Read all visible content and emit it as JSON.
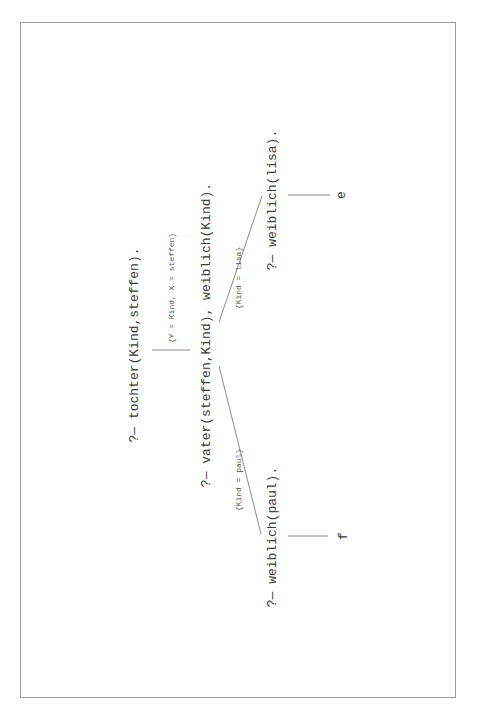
{
  "diagram": {
    "type": "sld-resolution-tree",
    "orientation": "rotated-90-ccw",
    "root": {
      "goal": "?— tochter(Kind,steffen)."
    },
    "step1": {
      "substitution": "{Y = Kind, X = steffen}",
      "goal": "?— vater(steffen,Kind), weiblich(Kind)."
    },
    "branches": [
      {
        "substitution": "{Kind = lisa}",
        "goal": "?— weiblich(lisa).",
        "result": "e"
      },
      {
        "substitution": "{Kind = paul}",
        "goal": "?— weiblich(paul).",
        "result": "f"
      }
    ]
  },
  "colors": {
    "text": "#3a3a3a",
    "lines": "#8a8a8a",
    "border": "#9a9a9a",
    "background": "#ffffff"
  }
}
